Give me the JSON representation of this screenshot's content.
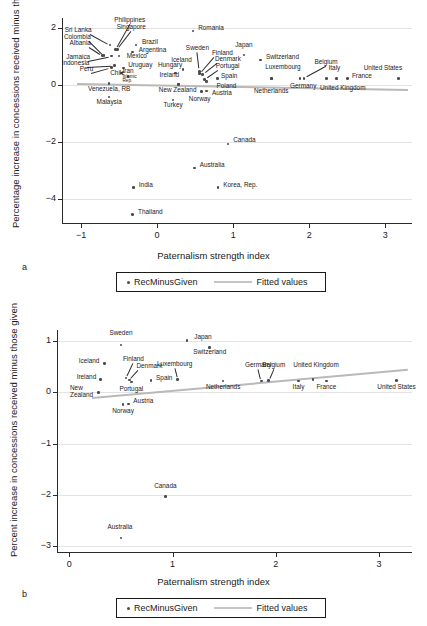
{
  "figure": {
    "panel_a_letter": "a",
    "panel_b_letter": "b"
  },
  "legend": {
    "series_label": "RecMinusGiven",
    "fit_label": "Fitted values"
  },
  "chart_data": [
    {
      "type": "scatter",
      "panel": "a",
      "title": "",
      "xlabel": "Paternalism strength index",
      "ylabel": "Percentage increase in concessions received minus those given",
      "xlim": [
        -1.25,
        3.35
      ],
      "ylim": [
        -4.85,
        2.35
      ],
      "xticks": [
        -1,
        0,
        1,
        2,
        3
      ],
      "xticklabels": [
        "−1",
        "0",
        "1",
        "2",
        "3"
      ],
      "yticks": [
        2,
        0,
        -2,
        -4
      ],
      "yticklabels": [
        "2",
        "0",
        "−2",
        "−4"
      ],
      "grid": "horizontal",
      "legend_position": "below",
      "fit": {
        "x0": -1.05,
        "y0": 0.03,
        "x1": 3.3,
        "y1": -0.18
      },
      "points": [
        {
          "name": "Sri Lanka",
          "x": -0.62,
          "y": 1.4,
          "lx": -0.86,
          "ly": 1.86,
          "align": "r"
        },
        {
          "name": "Philippines",
          "x": -0.55,
          "y": 1.25,
          "lx": -0.36,
          "ly": 2.22,
          "align": "c"
        },
        {
          "name": "Singapore",
          "x": -0.52,
          "y": 1.25,
          "lx": -0.34,
          "ly": 1.95,
          "align": "c"
        },
        {
          "name": "Colombia",
          "x": -0.7,
          "y": 1.03,
          "lx": -0.87,
          "ly": 1.62,
          "align": "r"
        },
        {
          "name": "Albania",
          "x": -0.72,
          "y": 1.03,
          "lx": -0.87,
          "ly": 1.4,
          "align": "r"
        },
        {
          "name": "Brazil",
          "x": -0.28,
          "y": 1.4,
          "lx": -0.2,
          "ly": 1.44,
          "align": "l"
        },
        {
          "name": "Argentina",
          "x": -0.32,
          "y": 1.15,
          "lx": -0.24,
          "ly": 1.17,
          "align": "l"
        },
        {
          "name": "Mexico",
          "x": -0.5,
          "y": 1.02,
          "lx": -0.4,
          "ly": 0.93,
          "align": "l"
        },
        {
          "name": "Jamaica",
          "x": -0.6,
          "y": 1.02,
          "lx": -0.88,
          "ly": 0.92,
          "align": "r"
        },
        {
          "name": "Indonesia",
          "x": -0.56,
          "y": 0.68,
          "lx": -0.89,
          "ly": 0.7,
          "align": "r"
        },
        {
          "name": "Peru",
          "x": -0.6,
          "y": 0.62,
          "lx": -0.84,
          "ly": 0.49,
          "align": "r"
        },
        {
          "name": "Uruguay",
          "x": -0.44,
          "y": 0.6,
          "lx": -0.38,
          "ly": 0.62,
          "align": "l"
        },
        {
          "name": "Chile",
          "x": -0.47,
          "y": 0.42,
          "lx": -0.52,
          "ly": 0.36,
          "align": "c"
        },
        {
          "name": "Iran, Islamic Rep.",
          "x": -0.38,
          "y": 0.3,
          "lx": -0.36,
          "ly": 0.42,
          "align": "c",
          "two_line": true
        },
        {
          "name": "Venezuela, RB",
          "x": -0.63,
          "y": 0.05,
          "lx": -0.63,
          "ly": -0.2,
          "align": "c"
        },
        {
          "name": "Malaysia",
          "x": -0.63,
          "y": -0.42,
          "lx": -0.63,
          "ly": -0.66,
          "align": "c"
        },
        {
          "name": "Romania",
          "x": 0.47,
          "y": 1.9,
          "lx": 0.54,
          "ly": 1.92,
          "align": "l"
        },
        {
          "name": "Sweden",
          "x": 0.56,
          "y": 0.48,
          "lx": 0.53,
          "ly": 1.22,
          "align": "c"
        },
        {
          "name": "Iceland",
          "x": 0.34,
          "y": 0.55,
          "lx": 0.32,
          "ly": 0.79,
          "align": "c"
        },
        {
          "name": "Hungary",
          "x": 0.24,
          "y": 0.42,
          "lx": 0.17,
          "ly": 0.62,
          "align": "c"
        },
        {
          "name": "Ireland",
          "x": 0.28,
          "y": 0.03,
          "lx": 0.16,
          "ly": 0.28,
          "align": "c"
        },
        {
          "name": "New Zealand",
          "x": 0.28,
          "y": 0.02,
          "lx": 0.27,
          "ly": -0.24,
          "align": "c"
        },
        {
          "name": "Turkey",
          "x": 0.21,
          "y": -0.53,
          "lx": 0.21,
          "ly": -0.76,
          "align": "c"
        },
        {
          "name": "Finland",
          "x": 0.56,
          "y": 0.4,
          "lx": 0.72,
          "ly": 1.05,
          "align": "l"
        },
        {
          "name": "Denmark",
          "x": 0.6,
          "y": 0.36,
          "lx": 0.76,
          "ly": 0.83,
          "align": "l"
        },
        {
          "name": "Portugal",
          "x": 0.62,
          "y": 0.2,
          "lx": 0.77,
          "ly": 0.6,
          "align": "l"
        },
        {
          "name": "Spain",
          "x": 0.79,
          "y": 0.22,
          "lx": 0.84,
          "ly": 0.23,
          "align": "l"
        },
        {
          "name": "Poland",
          "x": 0.65,
          "y": 0.13,
          "lx": 0.78,
          "ly": -0.1,
          "align": "l"
        },
        {
          "name": "Austria",
          "x": 0.65,
          "y": -0.22,
          "lx": 0.72,
          "ly": -0.37,
          "align": "l"
        },
        {
          "name": "Norway",
          "x": 0.58,
          "y": -0.23,
          "lx": 0.56,
          "ly": -0.56,
          "align": "c"
        },
        {
          "name": "Japan",
          "x": 1.14,
          "y": 1.05,
          "lx": 1.14,
          "ly": 1.32,
          "align": "c"
        },
        {
          "name": "Switzerland",
          "x": 1.36,
          "y": 0.88,
          "lx": 1.43,
          "ly": 0.9,
          "align": "l"
        },
        {
          "name": "Luxembourg",
          "x": 1.5,
          "y": 0.22,
          "lx": 1.42,
          "ly": 0.55,
          "align": "l"
        },
        {
          "name": "Netherlands",
          "x": 1.5,
          "y": 0.22,
          "lx": 1.5,
          "ly": -0.27,
          "align": "c"
        },
        {
          "name": "Germany",
          "x": 1.88,
          "y": 0.22,
          "lx": 1.92,
          "ly": -0.12,
          "align": "c"
        },
        {
          "name": "Belgium",
          "x": 1.93,
          "y": 0.23,
          "lx": 2.22,
          "ly": 0.72,
          "align": "c"
        },
        {
          "name": "Italy",
          "x": 2.23,
          "y": 0.22,
          "lx": 2.33,
          "ly": 0.53,
          "align": "c"
        },
        {
          "name": "United Kingdom",
          "x": 2.36,
          "y": 0.23,
          "lx": 2.44,
          "ly": -0.17,
          "align": "c"
        },
        {
          "name": "France",
          "x": 2.5,
          "y": 0.22,
          "lx": 2.56,
          "ly": 0.24,
          "align": "l"
        },
        {
          "name": "United States",
          "x": 3.17,
          "y": 0.22,
          "lx": 3.22,
          "ly": 0.52,
          "align": "r"
        },
        {
          "name": "Canada",
          "x": 0.93,
          "y": -2.07,
          "lx": 1.0,
          "ly": -2.02,
          "align": "l"
        },
        {
          "name": "Australia",
          "x": 0.49,
          "y": -2.92,
          "lx": 0.56,
          "ly": -2.88,
          "align": "l"
        },
        {
          "name": "India",
          "x": -0.31,
          "y": -3.6,
          "lx": -0.24,
          "ly": -3.58,
          "align": "l"
        },
        {
          "name": "Korea, Rep.",
          "x": 0.8,
          "y": -3.61,
          "lx": 0.87,
          "ly": -3.59,
          "align": "l"
        },
        {
          "name": "Thailand",
          "x": -0.32,
          "y": -4.56,
          "lx": -0.25,
          "ly": -4.54,
          "align": "l"
        }
      ]
    },
    {
      "type": "scatter",
      "panel": "b",
      "title": "",
      "xlabel": "Paternalism strength index",
      "ylabel": "Percent increase in concessions received minus those given",
      "xlim": [
        -0.12,
        3.32
      ],
      "ylim": [
        -3.12,
        1.22
      ],
      "xticks": [
        0,
        1,
        2,
        3
      ],
      "xticklabels": [
        "0",
        "1",
        "2",
        "3"
      ],
      "yticks": [
        1,
        0,
        -1,
        -2,
        -3
      ],
      "yticklabels": [
        "1",
        "0",
        "−1",
        "−2",
        "−3"
      ],
      "grid": "horizontal",
      "legend_position": "below",
      "fit": {
        "x0": 0.22,
        "y0": -0.1,
        "x1": 3.28,
        "y1": 0.45
      },
      "points": [
        {
          "name": "Sweden",
          "x": 0.5,
          "y": 0.93,
          "lx": 0.5,
          "ly": 1.12,
          "align": "c"
        },
        {
          "name": "Japan",
          "x": 1.14,
          "y": 1.02,
          "lx": 1.21,
          "ly": 1.04,
          "align": "l"
        },
        {
          "name": "Switzerland",
          "x": 1.36,
          "y": 0.88,
          "lx": 1.36,
          "ly": 0.76,
          "align": "c"
        },
        {
          "name": "Iceland",
          "x": 0.34,
          "y": 0.57,
          "lx": 0.29,
          "ly": 0.58,
          "align": "r"
        },
        {
          "name": "Finland",
          "x": 0.55,
          "y": 0.28,
          "lx": 0.62,
          "ly": 0.62,
          "align": "c"
        },
        {
          "name": "Denmark",
          "x": 0.58,
          "y": 0.24,
          "lx": 0.65,
          "ly": 0.48,
          "align": "l"
        },
        {
          "name": "Luxembourg",
          "x": 1.05,
          "y": 0.25,
          "lx": 1.02,
          "ly": 0.52,
          "align": "c"
        },
        {
          "name": "Germany",
          "x": 1.86,
          "y": 0.22,
          "lx": 1.83,
          "ly": 0.5,
          "align": "c"
        },
        {
          "name": "Belgium",
          "x": 1.93,
          "y": 0.23,
          "lx": 1.98,
          "ly": 0.5,
          "align": "c"
        },
        {
          "name": "United Kingdom",
          "x": 2.36,
          "y": 0.25,
          "lx": 2.39,
          "ly": 0.5,
          "align": "c"
        },
        {
          "name": "Ireland",
          "x": 0.3,
          "y": 0.25,
          "lx": 0.26,
          "ly": 0.26,
          "align": "r"
        },
        {
          "name": "Spain",
          "x": 0.79,
          "y": 0.23,
          "lx": 0.84,
          "ly": 0.24,
          "align": "l"
        },
        {
          "name": "Netherlands",
          "x": 1.49,
          "y": 0.22,
          "lx": 1.49,
          "ly": 0.06,
          "align": "c"
        },
        {
          "name": "Italy",
          "x": 2.22,
          "y": 0.22,
          "lx": 2.22,
          "ly": 0.06,
          "align": "c"
        },
        {
          "name": "France",
          "x": 2.49,
          "y": 0.22,
          "lx": 2.49,
          "ly": 0.06,
          "align": "c"
        },
        {
          "name": "United States",
          "x": 3.17,
          "y": 0.23,
          "lx": 3.17,
          "ly": 0.06,
          "align": "c"
        },
        {
          "name": "Portugal",
          "x": 0.6,
          "y": 0.2,
          "lx": 0.6,
          "ly": 0.03,
          "align": "c"
        },
        {
          "name": "New Zealand",
          "x": 0.28,
          "y": 0.0,
          "lx": 0.23,
          "ly": 0.05,
          "align": "r",
          "two_line_label": "New\nZealand"
        },
        {
          "name": "Austria",
          "x": 0.57,
          "y": -0.23,
          "lx": 0.62,
          "ly": -0.21,
          "align": "l"
        },
        {
          "name": "Norway",
          "x": 0.52,
          "y": -0.24,
          "lx": 0.52,
          "ly": -0.4,
          "align": "c"
        },
        {
          "name": "Canada",
          "x": 0.93,
          "y": -2.03,
          "lx": 0.93,
          "ly": -1.86,
          "align": "c"
        },
        {
          "name": "Australia",
          "x": 0.5,
          "y": -2.85,
          "lx": 0.49,
          "ly": -2.67,
          "align": "c"
        }
      ]
    }
  ]
}
